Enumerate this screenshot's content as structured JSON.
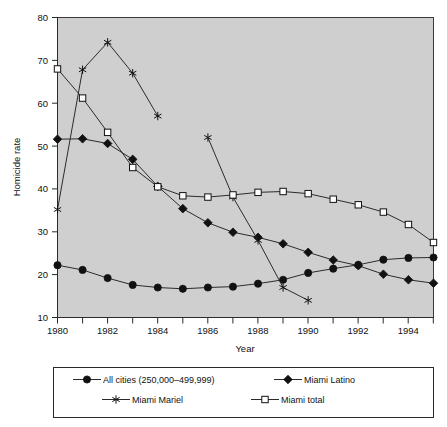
{
  "chart_data": {
    "type": "line",
    "title": "",
    "xlabel": "Year",
    "ylabel": "Homicide rate",
    "xlim": [
      1980,
      1995
    ],
    "ylim": [
      10,
      80
    ],
    "xticks": [
      1980,
      1981,
      1982,
      1983,
      1984,
      1985,
      1986,
      1987,
      1988,
      1989,
      1990,
      1991,
      1992,
      1993,
      1994,
      1995
    ],
    "xticklabels": [
      "1980",
      "",
      "1982",
      "",
      "1984",
      "",
      "1986",
      "",
      "1988",
      "",
      "1990",
      "",
      "1992",
      "",
      "1994",
      ""
    ],
    "yticks": [
      10,
      20,
      30,
      40,
      50,
      60,
      70,
      80
    ],
    "yticklabels": [
      "10",
      "20",
      "30",
      "40",
      "50",
      "60",
      "70",
      "80"
    ],
    "grid": false,
    "legend_position": "below-plot",
    "plot_background": "#cfcfcf",
    "x": [
      1980,
      1981,
      1982,
      1983,
      1984,
      1985,
      1986,
      1987,
      1988,
      1989,
      1990,
      1991,
      1992,
      1993,
      1994,
      1995
    ],
    "series": [
      {
        "name": "All cities (250,000–499,999)",
        "marker": "filled-circle",
        "color": "#111111",
        "x": [
          1980,
          1981,
          1982,
          1983,
          1984,
          1985,
          1986,
          1987,
          1988,
          1989,
          1990,
          1991,
          1992,
          1993,
          1994,
          1995
        ],
        "values": [
          22.2,
          21.1,
          19.2,
          17.6,
          17.0,
          16.7,
          17.0,
          17.2,
          17.9,
          18.8,
          20.4,
          21.4,
          22.3,
          23.5,
          23.9,
          24.0
        ]
      },
      {
        "name": "Miami Latino",
        "marker": "filled-diamond",
        "color": "#111111",
        "x": [
          1980,
          1981,
          1982,
          1983,
          1984,
          1985,
          1986,
          1987,
          1988,
          1989,
          1990,
          1991,
          1992,
          1993,
          1994,
          1995
        ],
        "values": [
          51.6,
          51.7,
          50.6,
          46.9,
          40.6,
          35.4,
          32.1,
          29.9,
          28.7,
          27.2,
          25.2,
          23.4,
          22.1,
          20.1,
          18.8,
          18.0
        ]
      },
      {
        "name": "Miami Mariel",
        "marker": "asterisk",
        "color": "#111111",
        "x": [
          1980,
          1981,
          1982,
          1983,
          1984,
          1986,
          1987,
          1988,
          1989,
          1990
        ],
        "values": [
          35.2,
          67.8,
          74.2,
          67.0,
          57.0,
          52.0,
          38.1,
          28.0,
          17.0,
          14.0
        ],
        "segments": [
          {
            "x": [
              1980,
              1981,
              1982,
              1983,
              1984
            ],
            "values": [
              35.2,
              67.8,
              74.2,
              67.0,
              57.0
            ]
          },
          {
            "x": [
              1986,
              1987,
              1988,
              1989,
              1990
            ],
            "values": [
              52.0,
              38.1,
              28.0,
              17.0,
              14.0
            ]
          }
        ]
      },
      {
        "name": "Miami total",
        "marker": "open-square",
        "color": "#111111",
        "x": [
          1980,
          1981,
          1982,
          1983,
          1984,
          1985,
          1986,
          1987,
          1988,
          1989,
          1990,
          1991,
          1992,
          1993,
          1994,
          1995
        ],
        "values": [
          68.0,
          61.2,
          53.2,
          45.0,
          40.5,
          38.4,
          38.1,
          38.6,
          39.2,
          39.4,
          38.9,
          37.6,
          36.3,
          34.6,
          31.7,
          27.5
        ]
      }
    ]
  },
  "axes": {
    "ylabel": "Homicide rate",
    "xlabel": "Year",
    "ytick_0": "10",
    "ytick_1": "20",
    "ytick_2": "30",
    "ytick_3": "40",
    "ytick_4": "50",
    "ytick_5": "60",
    "ytick_6": "70",
    "ytick_7": "80",
    "xtick_0": "1980",
    "xtick_1": "1982",
    "xtick_2": "1984",
    "xtick_3": "1986",
    "xtick_4": "1988",
    "xtick_5": "1990",
    "xtick_6": "1992",
    "xtick_7": "1994"
  },
  "legend": {
    "entries": [
      {
        "label": "All cities (250,000–499,999)",
        "marker": "filled-circle"
      },
      {
        "label": "Miami Latino",
        "marker": "filled-diamond"
      },
      {
        "label": "Miami Mariel",
        "marker": "asterisk"
      },
      {
        "label": "Miami total",
        "marker": "open-square"
      }
    ]
  }
}
